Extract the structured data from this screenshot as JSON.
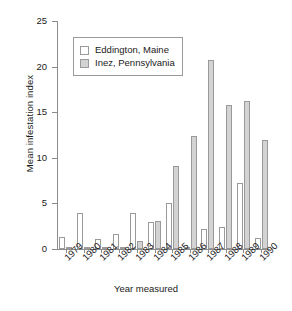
{
  "chart_data": {
    "type": "bar",
    "title": "",
    "xlabel": "Year measured",
    "ylabel": "Mean infestation index",
    "categories": [
      "1979",
      "1980",
      "1981",
      "1982",
      "1983",
      "1984",
      "1985",
      "1986",
      "1987",
      "1988",
      "1989",
      "1990"
    ],
    "series": [
      {
        "name": "Eddington, Maine",
        "color": "#ffffff",
        "values": [
          1.3,
          3.9,
          1.1,
          1.6,
          3.9,
          3.0,
          5.1,
          0.1,
          2.2,
          2.4,
          7.2,
          1.2
        ]
      },
      {
        "name": "Inez, Pennsylvania",
        "color": "#d3d3d3",
        "values": [
          0.2,
          0.2,
          0.15,
          0.2,
          0.9,
          3.1,
          9.1,
          12.4,
          20.7,
          15.8,
          16.2,
          12.0
        ]
      }
    ],
    "ylim": [
      0,
      25
    ],
    "yticks": [
      0,
      5,
      10,
      15,
      20,
      25
    ],
    "ytick_labels": [
      "0",
      "5",
      "10",
      "15",
      "20",
      "25"
    ],
    "grid": false,
    "legend_position": "upper left",
    "legend_entries": [
      "Eddington, Maine",
      "Inez, Pennsylvania"
    ]
  }
}
